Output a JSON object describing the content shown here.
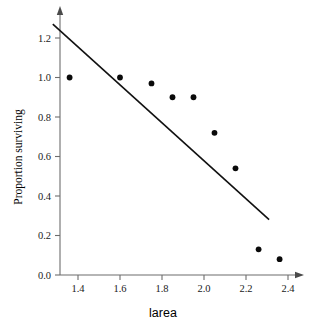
{
  "chart_data": {
    "type": "scatter",
    "title": "",
    "subtitle": "",
    "xlabel": "larea",
    "ylabel": "Proportion surviving",
    "xlim": [
      1.28,
      2.47
    ],
    "ylim": [
      0.0,
      1.3
    ],
    "xticks": [
      "1.4",
      "1.6",
      "1.8",
      "2.0",
      "2.2",
      "2.4"
    ],
    "xtick_values": [
      1.4,
      1.6,
      1.8,
      2.0,
      2.2,
      2.4
    ],
    "yticks": [
      "0.0",
      "0.2",
      "0.4",
      "0.6",
      "0.8",
      "1.0",
      "1.2"
    ],
    "ytick_values": [
      0.0,
      0.2,
      0.4,
      0.6,
      0.8,
      1.0,
      1.2
    ],
    "grid": false,
    "legend": false,
    "legend_position": "none",
    "axis_arrows": true,
    "marker": "filled-circle",
    "marker_color": "#0a0a0a",
    "line_color": "#111111",
    "axis_color": "#6d6d6d",
    "background_color": "#ffffff",
    "points": [
      {
        "x": 1.36,
        "y": 1.0
      },
      {
        "x": 1.6,
        "y": 1.0
      },
      {
        "x": 1.75,
        "y": 0.97
      },
      {
        "x": 1.85,
        "y": 0.9
      },
      {
        "x": 1.95,
        "y": 0.9
      },
      {
        "x": 2.05,
        "y": 0.72
      },
      {
        "x": 2.15,
        "y": 0.54
      },
      {
        "x": 2.26,
        "y": 0.13
      },
      {
        "x": 2.36,
        "y": 0.08
      }
    ],
    "series": [
      {
        "name": "observations",
        "type": "scatter",
        "x": [
          1.36,
          1.6,
          1.75,
          1.85,
          1.95,
          2.05,
          2.15,
          2.26,
          2.36
        ],
        "values": [
          1.0,
          1.0,
          0.97,
          0.9,
          0.9,
          0.72,
          0.54,
          0.13,
          0.08
        ]
      },
      {
        "name": "fitted-line",
        "type": "line",
        "x": [
          1.28,
          2.31
        ],
        "values": [
          1.27,
          0.28
        ]
      }
    ],
    "fit_line": {
      "x_start": 1.28,
      "y_start": 1.27,
      "x_end": 2.31,
      "y_end": 0.28
    }
  }
}
